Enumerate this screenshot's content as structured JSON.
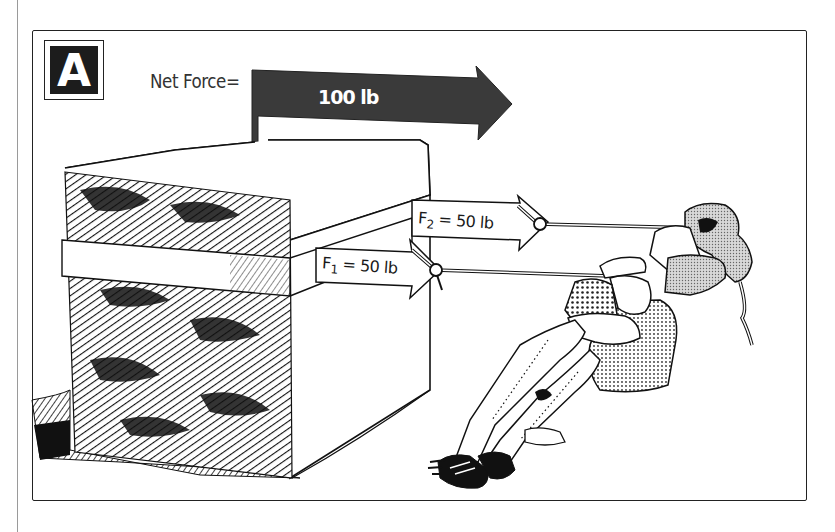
{
  "figure": {
    "panel_label": "A",
    "net_force": {
      "label": "Net Force=",
      "value": "100 lb",
      "arrow_color": "#3a3a3a"
    },
    "forces": [
      {
        "name": "F",
        "subscript": "1",
        "equals": " = ",
        "value": "50 lb"
      },
      {
        "name": "F",
        "subscript": "2",
        "equals": " = ",
        "value": "50 lb"
      }
    ],
    "scene": {
      "object": "hatched stone block",
      "agents": "two people pulling on ropes"
    }
  }
}
